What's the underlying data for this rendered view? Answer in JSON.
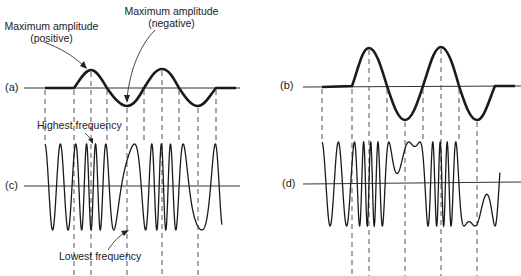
{
  "figure": {
    "panels": [
      {
        "id": "a",
        "label": "(a)",
        "description": "Modulating signal, small amplitude"
      },
      {
        "id": "b",
        "label": "(b)",
        "description": "Modulating signal, large amplitude"
      },
      {
        "id": "c",
        "label": "(c)",
        "description": "FM carrier modulated by (a)"
      },
      {
        "id": "d",
        "label": "(d)",
        "description": "FM carrier modulated by (b)"
      }
    ],
    "annotations": {
      "max_pos_line1": "Maximum amplitude",
      "max_pos_line2": "(positive)",
      "max_neg_line1": "Maximum amplitude",
      "max_neg_line2": "(negative)",
      "highest_freq": "Highest frequency",
      "lowest_freq": "Lowest frequency"
    },
    "colors": {
      "waveform": "#1a1a1a",
      "axis": "#333333",
      "dashed": "#555555",
      "background": "#ffffff"
    }
  }
}
